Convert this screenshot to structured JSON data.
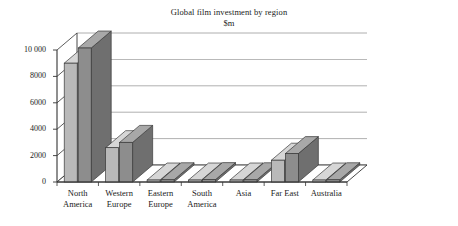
{
  "chart_data": {
    "type": "bar",
    "title": "Global film investment by region",
    "subtitle": "$m",
    "xlabel": "",
    "ylabel": "",
    "ylim": [
      0,
      10000
    ],
    "yticks": [
      "0",
      "2000",
      "4000",
      "6000",
      "8000",
      "10 000"
    ],
    "ytick_values": [
      0,
      2000,
      4000,
      6000,
      8000,
      10000
    ],
    "grid": true,
    "legend": "none",
    "style": "3d-grouped-columns",
    "categories": [
      "North America",
      "Western Europe",
      "Eastern Europe",
      "South America",
      "Asia",
      "Far East",
      "Australia"
    ],
    "series": [
      {
        "name": "Series 1",
        "color": "#b9b9b9",
        "values": [
          9000,
          2600,
          150,
          150,
          150,
          1650,
          150
        ]
      },
      {
        "name": "Series 2",
        "color": "#8d8d8d",
        "values": [
          10150,
          3000,
          170,
          180,
          170,
          2150,
          170
        ]
      }
    ]
  },
  "axis": {
    "category_labels": [
      {
        "line1": "North",
        "line2": "America"
      },
      {
        "line1": "Western",
        "line2": "Europe"
      },
      {
        "line1": "Eastern",
        "line2": "Europe"
      },
      {
        "line1": "South",
        "line2": "America"
      },
      {
        "line1": "Asia",
        "line2": ""
      },
      {
        "line1": "Far East",
        "line2": ""
      },
      {
        "line1": "Australia",
        "line2": ""
      }
    ]
  },
  "colors": {
    "series1_front": "#b9b9b9",
    "series1_side": "#9c9c9c",
    "series1_top": "#d6d6d6",
    "series2_front": "#8d8d8d",
    "series2_side": "#6f6f6f",
    "series2_top": "#a8a8a8",
    "grid": "#8c8c8c",
    "axis": "#333333",
    "floor": "#ffffff",
    "background": "#ffffff"
  }
}
